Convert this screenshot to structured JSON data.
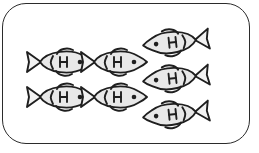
{
  "scene": {
    "title": "Fish counting picture",
    "background_color": "#ffffff",
    "frame": {
      "shape": "rounded-rectangle",
      "border_color": "#2b2b2b",
      "fill_color": "#ffffff",
      "corner_radius": "24px"
    },
    "icon": {
      "name": "fish-icon",
      "body_fill": "#e8e8e8",
      "outline_color": "#1f1f1f",
      "eye_color": "#1f1f1f"
    },
    "total_count": 7,
    "groups": [
      {
        "name": "left-group",
        "count": 4,
        "direction": "facing-right",
        "layout": "2x2-grid",
        "items": [
          {
            "label": "fish-1",
            "row": 1,
            "col": 1
          },
          {
            "label": "fish-2",
            "row": 1,
            "col": 2
          },
          {
            "label": "fish-3",
            "row": 2,
            "col": 1
          },
          {
            "label": "fish-4",
            "row": 2,
            "col": 2
          }
        ]
      },
      {
        "name": "right-group",
        "count": 3,
        "direction": "facing-left",
        "layout": "vertical-column",
        "items": [
          {
            "label": "fish-5",
            "row": 1,
            "col": 1
          },
          {
            "label": "fish-6",
            "row": 2,
            "col": 1
          },
          {
            "label": "fish-7",
            "row": 3,
            "col": 1
          }
        ]
      }
    ]
  }
}
